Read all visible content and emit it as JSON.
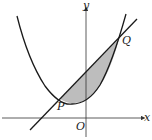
{
  "figure": {
    "labels": {
      "y_axis": "y",
      "x_axis": "x",
      "origin": "O",
      "point_p": "P",
      "point_q": "Q"
    },
    "colors": {
      "stroke": "#1a1a1a",
      "shade": "#bdbdbd",
      "axis": "#333333"
    }
  }
}
